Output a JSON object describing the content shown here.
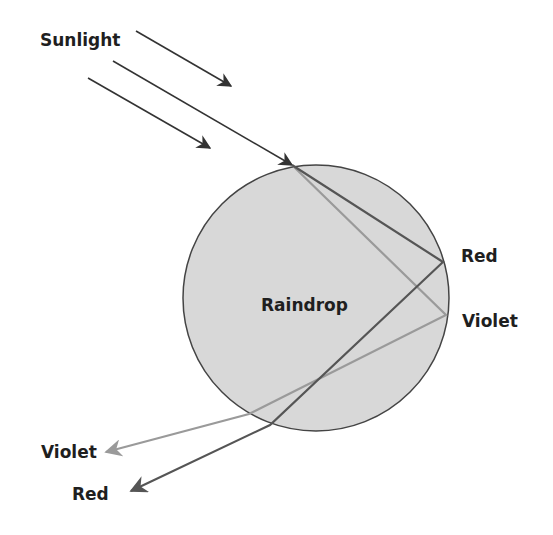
{
  "diagram": {
    "labels": {
      "sunlight": "Sunlight",
      "raindrop": "Raindrop",
      "red_reflect": "Red",
      "violet_reflect": "Violet",
      "violet_exit": "Violet",
      "red_exit": "Red"
    },
    "colors": {
      "background": "#ffffff",
      "raindrop_fill": "#d8d8d8",
      "raindrop_stroke": "#444444",
      "sun_ray": "#333333",
      "red_ray": "#555555",
      "violet_ray": "#9a9a9a",
      "text": "#1f1f1f"
    },
    "raindrop": {
      "cx": 316,
      "cy": 298,
      "r": 133
    },
    "sun_rays": [
      {
        "x1": 136,
        "y1": 31,
        "x2": 231,
        "y2": 86
      },
      {
        "x1": 113,
        "y1": 61,
        "x2": 292,
        "y2": 165
      },
      {
        "x1": 88,
        "y1": 78,
        "x2": 210,
        "y2": 148
      }
    ],
    "red_path": [
      [
        292,
        165
      ],
      [
        443,
        262
      ],
      [
        270,
        425
      ],
      [
        131,
        491
      ]
    ],
    "violet_path": [
      [
        292,
        165
      ],
      [
        446,
        315
      ],
      [
        249,
        414
      ],
      [
        106,
        452
      ]
    ]
  }
}
